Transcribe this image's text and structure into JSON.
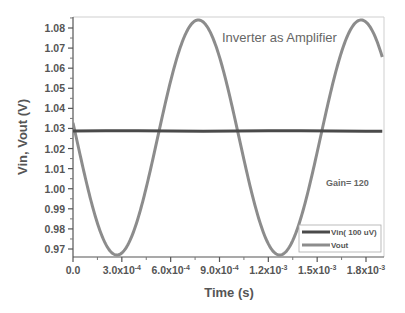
{
  "chart_data": {
    "type": "line",
    "title": "Inverter as Amplifier",
    "xlabel": "Time (s)",
    "ylabel": "Vin, Vout (V)",
    "xlim": [
      0,
      0.0019
    ],
    "ylim": [
      0.965,
      1.085
    ],
    "x_ticks": [
      0,
      0.0003,
      0.0006,
      0.0009,
      0.0012,
      0.0015,
      0.0018
    ],
    "x_tick_labels": [
      {
        "mant": "0.0",
        "exp": ""
      },
      {
        "mant": "3.0x10",
        "exp": "-4"
      },
      {
        "mant": "6.0x10",
        "exp": "-4"
      },
      {
        "mant": "9.0x10",
        "exp": "-4"
      },
      {
        "mant": "1.2x10",
        "exp": "-3"
      },
      {
        "mant": "1.5x10",
        "exp": "-3"
      },
      {
        "mant": "1.8x10",
        "exp": "-3"
      }
    ],
    "y_ticks": [
      0.97,
      0.98,
      0.99,
      1.0,
      1.01,
      1.02,
      1.03,
      1.04,
      1.05,
      1.06,
      1.07,
      1.08
    ],
    "y_tick_labels": [
      "0.97",
      "0.98",
      "0.99",
      "1.00",
      "1.01",
      "1.02",
      "1.03",
      "1.04",
      "1.05",
      "1.06",
      "1.07",
      "1.08"
    ],
    "grid": false,
    "legend_position": "lower right",
    "annotations": [
      {
        "text": "Inverter as Amplifier",
        "x": 0.00122,
        "y": 1.078
      },
      {
        "text": "Gain= 120",
        "x": 0.00166,
        "y": 1.005
      }
    ],
    "series": [
      {
        "name": "Vin( 100 uV)",
        "color": "#4a4a4a",
        "line_width": 3,
        "x": [
          0,
          0.0002,
          0.0004,
          0.0006,
          0.0008,
          0.001,
          0.0012,
          0.0014,
          0.0016,
          0.0018,
          0.0019
        ],
        "y": [
          1.0287,
          1.0288,
          1.0288,
          1.0287,
          1.0286,
          1.0287,
          1.0288,
          1.0288,
          1.0287,
          1.0286,
          1.0286
        ]
      },
      {
        "name": "Vout",
        "color": "#8c8c8c",
        "line_width": 3,
        "waveform": "sine",
        "offset": 1.0255,
        "amplitude": 0.0585,
        "period": 0.001,
        "phase_peak_t": 0.00077,
        "x": [
          0,
          0.0001,
          0.00027,
          0.0004,
          0.00052,
          0.00065,
          0.00077,
          0.0009,
          0.00102,
          0.00115,
          0.00127,
          0.0014,
          0.00152,
          0.00165,
          0.00177,
          0.0019
        ],
        "y": [
          1.037,
          0.999,
          0.967,
          0.982,
          1.026,
          1.067,
          1.084,
          1.067,
          1.026,
          0.982,
          0.967,
          0.982,
          1.026,
          1.067,
          1.084,
          1.06
        ]
      }
    ]
  }
}
